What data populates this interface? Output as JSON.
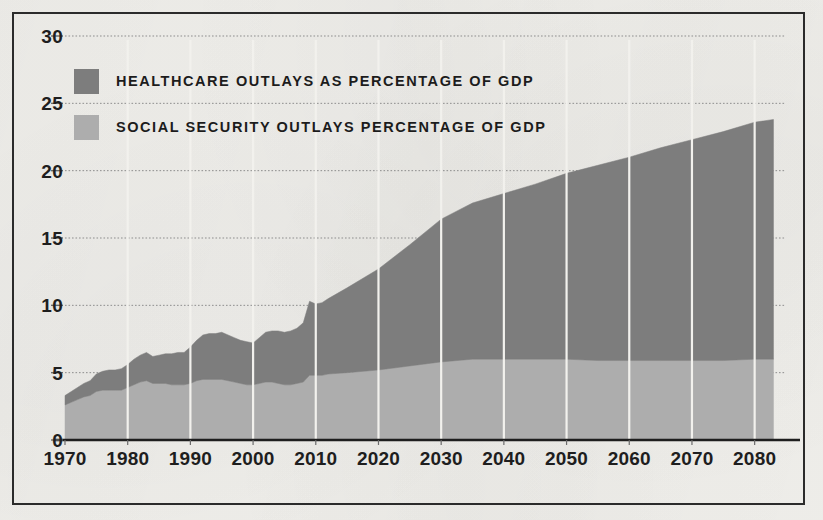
{
  "figure": {
    "background_color": "#f2f1ed",
    "frame_color": "#2b2b2b"
  },
  "legend": {
    "position": "inside-top-left",
    "items": [
      {
        "label": "HEALTHCARE OUTLAYS AS PERCENTAGE OF GDP",
        "color": "#7d7d7d",
        "swatch_name": "healthcare-swatch"
      },
      {
        "label": "SOCIAL SECURITY OUTLAYS PERCENTAGE OF GDP",
        "color": "#adadad",
        "swatch_name": "social-security-swatch"
      }
    ]
  },
  "chart_data": {
    "type": "area",
    "stacked": true,
    "title": "",
    "subtitle": "",
    "xlabel": "",
    "ylabel": "",
    "xlim": [
      1970,
      2085
    ],
    "ylim": [
      0,
      30
    ],
    "yticks": [
      0,
      5,
      10,
      15,
      20,
      25,
      30
    ],
    "ytick_labels": [
      "0",
      "5",
      "10",
      "15",
      "20",
      "25",
      "30"
    ],
    "xticks": [
      1970,
      1980,
      1990,
      2000,
      2010,
      2020,
      2030,
      2040,
      2050,
      2060,
      2070,
      2080
    ],
    "xtick_labels": [
      "1970",
      "1980",
      "1990",
      "2000",
      "2010",
      "2020",
      "2030",
      "2040",
      "2050",
      "2060",
      "2070",
      "2080"
    ],
    "grid": {
      "horizontal": true,
      "horizontal_style": "dotted",
      "horizontal_color": "#8d8d8d",
      "vertical": true,
      "vertical_style": "solid",
      "vertical_color": "#f2f1ed",
      "vertical_at_xticks": true
    },
    "series": [
      {
        "name": "SOCIAL SECURITY OUTLAYS PERCENTAGE OF GDP",
        "color": "#adadad",
        "stack_order": 1,
        "x": [
          1970,
          1971,
          1972,
          1973,
          1974,
          1975,
          1976,
          1977,
          1978,
          1979,
          1980,
          1981,
          1982,
          1983,
          1984,
          1985,
          1986,
          1987,
          1988,
          1989,
          1990,
          1991,
          1992,
          1993,
          1994,
          1995,
          1996,
          1997,
          1998,
          1999,
          2000,
          2001,
          2002,
          2003,
          2004,
          2005,
          2006,
          2007,
          2008,
          2009,
          2010,
          2011,
          2012,
          2015,
          2020,
          2025,
          2030,
          2035,
          2040,
          2045,
          2050,
          2055,
          2060,
          2065,
          2070,
          2075,
          2080,
          2083
        ],
        "values": [
          2.6,
          2.8,
          3.0,
          3.2,
          3.3,
          3.6,
          3.7,
          3.7,
          3.7,
          3.7,
          3.9,
          4.1,
          4.3,
          4.4,
          4.2,
          4.2,
          4.2,
          4.1,
          4.1,
          4.1,
          4.2,
          4.4,
          4.5,
          4.5,
          4.5,
          4.5,
          4.4,
          4.3,
          4.2,
          4.1,
          4.1,
          4.2,
          4.3,
          4.3,
          4.2,
          4.1,
          4.1,
          4.2,
          4.3,
          4.8,
          4.8,
          4.8,
          4.9,
          5.0,
          5.2,
          5.5,
          5.8,
          6.0,
          6.0,
          6.0,
          6.0,
          5.9,
          5.9,
          5.9,
          5.9,
          5.9,
          6.0,
          6.0
        ],
        "first_value": 2.6,
        "last_value": 6.0,
        "peak_value": 6.0
      },
      {
        "name": "HEALTHCARE OUTLAYS AS PERCENTAGE OF GDP",
        "color": "#7d7d7d",
        "stack_order": 2,
        "x": [
          1970,
          1971,
          1972,
          1973,
          1974,
          1975,
          1976,
          1977,
          1978,
          1979,
          1980,
          1981,
          1982,
          1983,
          1984,
          1985,
          1986,
          1987,
          1988,
          1989,
          1990,
          1991,
          1992,
          1993,
          1994,
          1995,
          1996,
          1997,
          1998,
          1999,
          2000,
          2001,
          2002,
          2003,
          2004,
          2005,
          2006,
          2007,
          2008,
          2009,
          2010,
          2011,
          2012,
          2015,
          2020,
          2025,
          2030,
          2035,
          2040,
          2045,
          2050,
          2055,
          2060,
          2065,
          2070,
          2075,
          2080,
          2083
        ],
        "values": [
          0.7,
          0.8,
          0.9,
          1.0,
          1.1,
          1.3,
          1.4,
          1.5,
          1.5,
          1.6,
          1.7,
          1.9,
          2.0,
          2.1,
          2.0,
          2.1,
          2.2,
          2.3,
          2.4,
          2.4,
          2.7,
          3.0,
          3.3,
          3.4,
          3.4,
          3.5,
          3.4,
          3.3,
          3.2,
          3.2,
          3.1,
          3.4,
          3.7,
          3.8,
          3.9,
          3.9,
          4.0,
          4.1,
          4.4,
          5.5,
          5.3,
          5.4,
          5.6,
          6.3,
          7.5,
          9.0,
          10.6,
          11.6,
          12.3,
          13.0,
          13.8,
          14.5,
          15.1,
          15.8,
          16.4,
          17.0,
          17.6,
          17.8
        ],
        "first_value": 0.7,
        "last_value": 17.8
      }
    ],
    "totals": {
      "name": "Total outlays (stacked)",
      "x": [
        1970,
        1975,
        1980,
        1983,
        1990,
        1993,
        2000,
        2008,
        2009,
        2012,
        2020,
        2030,
        2040,
        2050,
        2060,
        2070,
        2080,
        2083
      ],
      "values": [
        3.3,
        4.9,
        5.6,
        6.5,
        6.9,
        7.9,
        7.2,
        8.7,
        10.3,
        10.5,
        12.7,
        16.4,
        18.3,
        19.8,
        21.0,
        22.3,
        23.6,
        23.8
      ],
      "notes": "Stacked total rises from about 3.3% of GDP in 1970 to about 23.8% by 2083, with a recession spike near 2009."
    }
  }
}
